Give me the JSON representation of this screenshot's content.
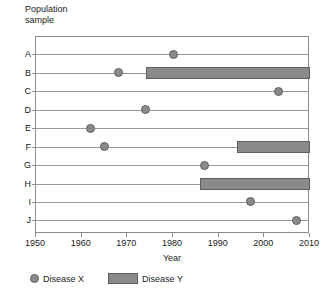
{
  "chart_data": {
    "type": "scatter",
    "title": "",
    "ylabel": "Population\nsample",
    "xlabel": "Year",
    "xlim": [
      1950,
      2010
    ],
    "xticks": [
      1950,
      1960,
      1970,
      1980,
      1990,
      2000,
      2010
    ],
    "xtick_labels": [
      "1950",
      "1960",
      "1970",
      "1980",
      "1990",
      "2000",
      "2010"
    ],
    "categories": [
      "A",
      "B",
      "C",
      "D",
      "E",
      "F",
      "G",
      "H",
      "I",
      "J"
    ],
    "grid": false,
    "legend_position": "bottom-left",
    "series": [
      {
        "name": "Disease X",
        "marker": "circle",
        "color": "#8a8a8a",
        "values": [
          1980,
          1968,
          2003,
          1974,
          1962,
          1965,
          1987,
          null,
          1997,
          2007
        ]
      },
      {
        "name": "Disease Y",
        "marker": "bar",
        "color": "#8a8a8a",
        "spans": [
          null,
          [
            1974,
            2010
          ],
          null,
          null,
          null,
          [
            1994,
            2010
          ],
          null,
          [
            1986,
            2010
          ],
          null,
          null
        ]
      }
    ],
    "rows": [
      {
        "label": "A",
        "disease_x_year": 1980,
        "disease_y_span": null
      },
      {
        "label": "B",
        "disease_x_year": 1968,
        "disease_y_span": [
          1974,
          2010
        ]
      },
      {
        "label": "C",
        "disease_x_year": 2003,
        "disease_y_span": null
      },
      {
        "label": "D",
        "disease_x_year": 1974,
        "disease_y_span": null
      },
      {
        "label": "E",
        "disease_x_year": 1962,
        "disease_y_span": null
      },
      {
        "label": "F",
        "disease_x_year": 1965,
        "disease_y_span": [
          1994,
          2010
        ]
      },
      {
        "label": "G",
        "disease_x_year": 1987,
        "disease_y_span": null
      },
      {
        "label": "H",
        "disease_x_year": null,
        "disease_y_span": [
          1986,
          2010
        ]
      },
      {
        "label": "I",
        "disease_x_year": 1997,
        "disease_y_span": null
      },
      {
        "label": "J",
        "disease_x_year": 2007,
        "disease_y_span": null
      }
    ]
  },
  "axes": {
    "y_title": "Population\nsample",
    "x_title": "Year"
  },
  "legend": {
    "items": [
      {
        "label": "Disease X",
        "type": "circle"
      },
      {
        "label": "Disease Y",
        "type": "bar"
      }
    ]
  },
  "colors": {
    "marker": "#8a8a8a",
    "marker_edge": "#5f5f5f",
    "line": "#9a9a9a",
    "frame": "#8c8c8c",
    "text": "#1a1a1a",
    "background": "#ffffff"
  }
}
